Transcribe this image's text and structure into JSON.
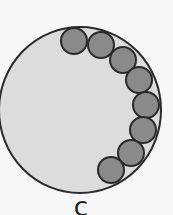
{
  "figure": {
    "label": "c",
    "colors": {
      "background": "#f7f7f7",
      "large_circle_fill": "#dcdcdc",
      "small_circle_fill": "#8a8a8a",
      "stroke": "#2a2a2a"
    },
    "large_circle": {
      "cx": 80,
      "cy": 110,
      "rx": 81,
      "ry": 83
    },
    "small_circles": [
      {
        "cx": 74,
        "cy": 41,
        "r": 13
      },
      {
        "cx": 101,
        "cy": 45,
        "r": 13
      },
      {
        "cx": 123,
        "cy": 60,
        "r": 13
      },
      {
        "cx": 139,
        "cy": 80,
        "r": 13
      },
      {
        "cx": 146,
        "cy": 105,
        "r": 13
      },
      {
        "cx": 143,
        "cy": 130,
        "r": 13
      },
      {
        "cx": 131,
        "cy": 153,
        "r": 13
      },
      {
        "cx": 111,
        "cy": 170,
        "r": 13
      }
    ]
  }
}
